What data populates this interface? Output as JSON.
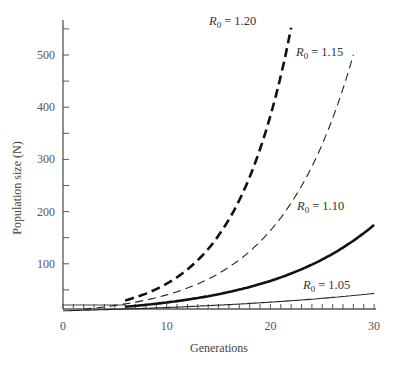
{
  "chart_data": {
    "type": "line",
    "title": "",
    "xlabel": "Generations",
    "ylabel": "Population size (N)",
    "xlim": [
      0,
      30
    ],
    "ylim": [
      0,
      560
    ],
    "x_ticks": [
      0,
      10,
      20,
      30
    ],
    "x_minor_step": 1,
    "y_ticks": [
      100,
      200,
      300,
      400,
      500
    ],
    "y_minor_step": 50,
    "grid": false,
    "legend": "inline labels at curve ends",
    "initial_population": 10,
    "series": [
      {
        "name": "R0 = 1.20",
        "label_base": "R",
        "label_sub": "0",
        "label_value": "= 1.20",
        "R0": 1.2,
        "x_start": 6,
        "x_end": 22,
        "style": "heavy-dashed"
      },
      {
        "name": "R0 = 1.15",
        "label_base": "R",
        "label_sub": "0",
        "label_value": "= 1.15",
        "R0": 1.15,
        "x_start": 2,
        "x_end": 28,
        "style": "light-dashed"
      },
      {
        "name": "R0 = 1.10",
        "label_base": "R",
        "label_sub": "0",
        "label_value": "= 1.10",
        "R0": 1.1,
        "x_start": 6,
        "x_end": 30,
        "style": "heavy-solid"
      },
      {
        "name": "R0 = 1.05",
        "label_base": "R",
        "label_sub": "0",
        "label_value": "= 1.05",
        "R0": 1.05,
        "x_start": 0,
        "x_end": 30,
        "style": "light-solid"
      }
    ],
    "approx_values": {
      "R0 = 1.20": {
        "x": [
          6,
          10,
          14,
          18,
          22
        ],
        "y": [
          30,
          62,
          128,
          267,
          553
        ]
      },
      "R0 = 1.15": {
        "x": [
          2,
          8,
          14,
          20,
          24,
          28
        ],
        "y": [
          13,
          31,
          71,
          164,
          286,
          500
        ]
      },
      "R0 = 1.10": {
        "x": [
          6,
          12,
          18,
          24,
          30
        ],
        "y": [
          18,
          31,
          56,
          98,
          174
        ]
      },
      "R0 = 1.05": {
        "x": [
          0,
          10,
          20,
          30
        ],
        "y": [
          10,
          16,
          27,
          43
        ]
      }
    }
  }
}
